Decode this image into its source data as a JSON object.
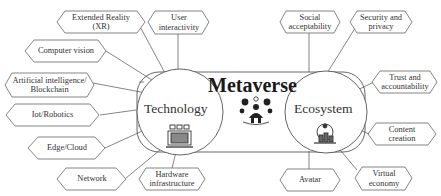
{
  "diagram": {
    "title": "Metaverse",
    "hubs": [
      {
        "id": "technology",
        "label": "Technology",
        "icon": "computer-network-icon"
      },
      {
        "id": "ecosystem",
        "label": "Ecosystem",
        "icon": "city-globe-icon"
      }
    ],
    "center_icon": "people-network-icon",
    "technology_nodes": [
      {
        "label": "Extended Reality (XR)",
        "line1": "Extended Reality",
        "line2": "(XR)"
      },
      {
        "label": "User interactivity",
        "line1": "User",
        "line2": "interactivity"
      },
      {
        "label": "Computer vision",
        "line1": "Computer vision",
        "line2": ""
      },
      {
        "label": "Artificial intelligence/ Blockchain",
        "line1": "Artificial intelligence/",
        "line2": "Blockchain"
      },
      {
        "label": "Iot/Robotics",
        "line1": "Iot/Robotics",
        "line2": ""
      },
      {
        "label": "Edge/Cloud",
        "line1": "Edge/Cloud",
        "line2": ""
      },
      {
        "label": "Network",
        "line1": "Network",
        "line2": ""
      },
      {
        "label": "Hardware infrastructure",
        "line1": "Hardware",
        "line2": "infrastructure"
      }
    ],
    "ecosystem_nodes": [
      {
        "label": "Social acceptability",
        "line1": "Social",
        "line2": "acceptability"
      },
      {
        "label": "Security and privacy",
        "line1": "Security and",
        "line2": "privacy"
      },
      {
        "label": "Trust and accountability",
        "line1": "Trust and",
        "line2": "accountability"
      },
      {
        "label": "Content creation",
        "line1": "Content",
        "line2": "creation"
      },
      {
        "label": "Avatar",
        "line1": "Avatar",
        "line2": ""
      },
      {
        "label": "Virtual economy",
        "line1": "Virtual",
        "line2": "economy"
      }
    ],
    "colors": {
      "stroke": "#555555",
      "text": "#333333",
      "background": "#ffffff"
    }
  }
}
